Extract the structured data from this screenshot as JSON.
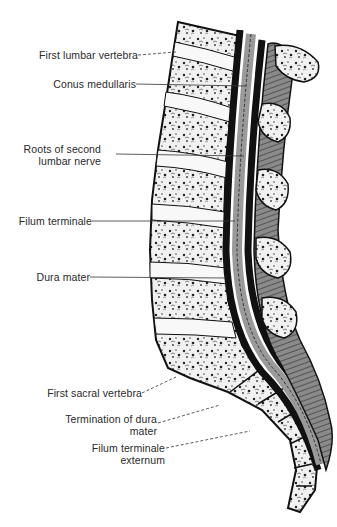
{
  "figure": {
    "colors": {
      "ink": "#111111",
      "bone_fill": "#f2f2f2",
      "disc_fill": "#f7f7f7",
      "cord_gray": "#9a9a9a",
      "muscle": "#6a6a6a",
      "label_text": "#2a2a2a"
    }
  },
  "labels": [
    {
      "id": "first-lumbar-vertebra",
      "lines": [
        "First lumbar vertebra"
      ]
    },
    {
      "id": "conus-medullaris",
      "lines": [
        "Conus medullaris"
      ]
    },
    {
      "id": "roots-of-second-lumbar-nerve",
      "lines": [
        "Roots of second",
        "lumbar nerve"
      ]
    },
    {
      "id": "filum-terminale",
      "lines": [
        "Filum terminale"
      ]
    },
    {
      "id": "dura-mater",
      "lines": [
        "Dura mater"
      ]
    },
    {
      "id": "first-sacral-vertebra",
      "lines": [
        "First sacral vertebra"
      ]
    },
    {
      "id": "termination-of-dura-mater",
      "lines": [
        "Termination of dura",
        "mater"
      ]
    },
    {
      "id": "filum-terminale-externum",
      "lines": [
        "Filum terminale",
        "externum"
      ]
    }
  ]
}
